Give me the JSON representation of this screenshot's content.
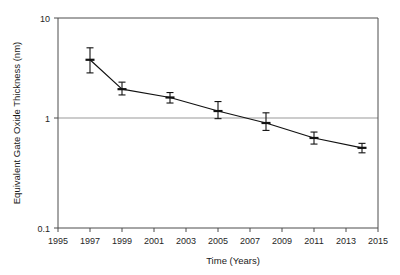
{
  "chart_data": {
    "type": "line",
    "title": "",
    "xlabel": "Time (Years)",
    "ylabel": "Equivalent Gate Oxide Thickness (nm)",
    "yscale": "log",
    "xscale": "linear",
    "xlim": [
      1995,
      2015
    ],
    "ylim": [
      0.1,
      10
    ],
    "grid": "horizontal-at-1",
    "legend": "none",
    "x_ticks": [
      1995,
      1997,
      1999,
      2001,
      2003,
      2005,
      2007,
      2009,
      2011,
      2013,
      2015
    ],
    "x_tick_labels": [
      "1995",
      "1997",
      "1999",
      "2001",
      "2003",
      "2005",
      "2007",
      "2009",
      "2011",
      "2013",
      "2015"
    ],
    "y_ticks": [
      0.1,
      1,
      10
    ],
    "y_tick_labels": [
      "0.1",
      "1",
      "10"
    ],
    "series": [
      {
        "name": "Equivalent gate oxide thickness",
        "marker": "horizontal-dash",
        "color": "#111111",
        "x": [
          1997,
          1999,
          2002,
          2005,
          2008,
          2011,
          2014
        ],
        "values": [
          4.0,
          2.1,
          1.75,
          1.3,
          1.0,
          0.72,
          0.58
        ],
        "yerr_low": [
          3.0,
          1.85,
          1.55,
          1.1,
          0.85,
          0.63,
          0.52
        ],
        "yerr_high": [
          5.2,
          2.45,
          1.95,
          1.6,
          1.25,
          0.82,
          0.64
        ]
      }
    ]
  }
}
